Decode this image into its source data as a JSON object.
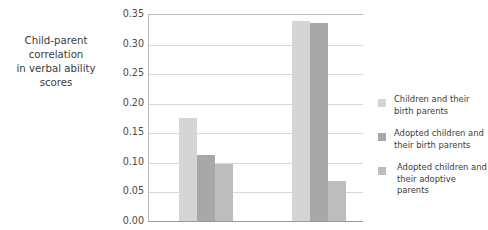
{
  "chart_data": {
    "type": "bar",
    "title": "",
    "subtitle": "",
    "xlabel": "",
    "ylabel": "Child-parent correlation\nin verbal ability scores",
    "ylim": [
      0.0,
      0.35
    ],
    "ytick_labels": [
      "0.35",
      "0.30",
      "0.25",
      "0.20",
      "0.15",
      "0.10",
      "0.05",
      "0.00"
    ],
    "ytick_values": [
      0.35,
      0.3,
      0.25,
      0.2,
      0.15,
      0.1,
      0.05,
      0.0
    ],
    "grid": true,
    "legend_position": "right",
    "categories": [
      "Group 1",
      "Group 2"
    ],
    "series": [
      {
        "name": "Children and their birth parents",
        "color": "#d5d5d5",
        "values": [
          0.175,
          0.339
        ]
      },
      {
        "name": "Adopted children and their birth parents",
        "color": "#a8a8a8",
        "values": [
          0.112,
          0.334
        ]
      },
      {
        "name": "Adopted children and their adoptive parents",
        "color": "#bdbdbd",
        "values": [
          0.097,
          0.068
        ]
      }
    ]
  },
  "axis": {
    "title_line1": "Child-parent correlation",
    "title_line2": "in verbal ability scores",
    "ticks": [
      {
        "label": "0.35"
      },
      {
        "label": "0.30"
      },
      {
        "label": "0.25"
      },
      {
        "label": "0.20"
      },
      {
        "label": "0.15"
      },
      {
        "label": "0.10"
      },
      {
        "label": "0.05"
      },
      {
        "label": "0.00"
      }
    ]
  },
  "legend": {
    "items": [
      {
        "line1": "Children and their",
        "line2": "birth parents",
        "color": "#d5d5d5"
      },
      {
        "line1": "Adopted children and",
        "line2": "their birth parents",
        "color": "#a8a8a8"
      },
      {
        "line1": "Adopted children and",
        "line2": "their adoptive parents",
        "color": "#bdbdbd"
      }
    ]
  },
  "colors": {
    "gridline": "#d8d8d8",
    "axis": "#9a9a9a",
    "text": "#3a3a3a",
    "background": "#ffffff"
  }
}
